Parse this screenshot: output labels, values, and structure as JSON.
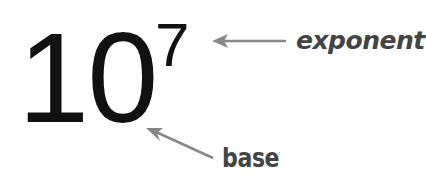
{
  "expression": {
    "base": "10",
    "exponent": "7"
  },
  "annotations": {
    "exponent_label": "exponent",
    "base_label": "base"
  },
  "colors": {
    "numerals": "#111111",
    "labels": "#444444",
    "arrows": "#888888",
    "background": "#ffffff"
  }
}
